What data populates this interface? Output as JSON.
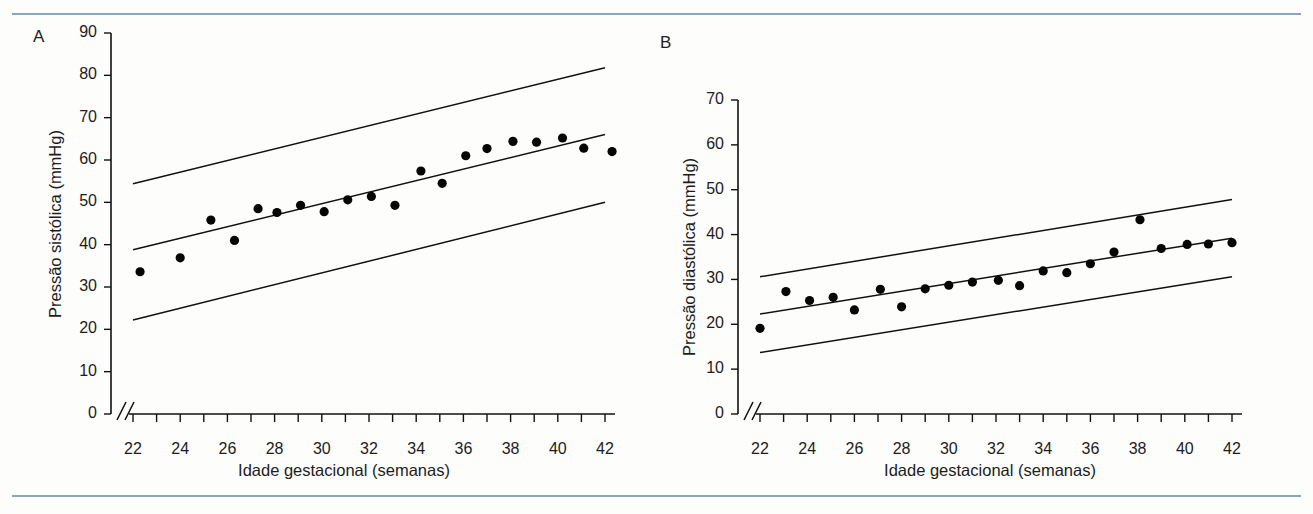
{
  "figure": {
    "background": "#fdfdfc",
    "rule_color": "#8ea3bd",
    "axis_color": "#111111",
    "point_color": "#050505"
  },
  "panels": [
    {
      "label": "A",
      "xlabel": "Idade gestacional (semanas)",
      "ylabel": "Pressão sistólica (mmHg)",
      "ylim": [
        0,
        90
      ],
      "yticks": [
        0,
        10,
        20,
        30,
        40,
        50,
        60,
        70,
        80,
        90
      ],
      "xlim": [
        22,
        42
      ],
      "xticks_all": [
        22,
        23,
        24,
        25,
        26,
        27,
        28,
        29,
        30,
        31,
        32,
        33,
        34,
        35,
        36,
        37,
        38,
        39,
        40,
        41,
        42
      ],
      "xticklabels": [
        "22",
        "24",
        "26",
        "28",
        "30",
        "32",
        "34",
        "36",
        "38",
        "40",
        "42"
      ],
      "xticklabel_values": [
        22,
        24,
        26,
        28,
        30,
        32,
        34,
        36,
        38,
        40,
        42
      ],
      "axis_break": true
    },
    {
      "label": "B",
      "xlabel": "Idade gestacional (semanas)",
      "ylabel": "Pressão diastólica (mmHg)",
      "ylim": [
        0,
        70
      ],
      "yticks": [
        0,
        10,
        20,
        30,
        40,
        50,
        60,
        70
      ],
      "xlim": [
        22,
        42
      ],
      "xticks_all": [
        22,
        23,
        24,
        25,
        26,
        27,
        28,
        29,
        30,
        31,
        32,
        33,
        34,
        35,
        36,
        37,
        38,
        39,
        40,
        41,
        42
      ],
      "xticklabels": [
        "22",
        "24",
        "26",
        "28",
        "30",
        "32",
        "34",
        "36",
        "38",
        "40",
        "42"
      ],
      "xticklabel_values": [
        22,
        24,
        26,
        28,
        30,
        32,
        34,
        36,
        38,
        40,
        42
      ],
      "axis_break": true
    }
  ],
  "chart_data": [
    {
      "type": "scatter",
      "panel": "A",
      "title": "",
      "xlabel": "Idade gestacional (semanas)",
      "ylabel": "Pressão sistólica (mmHg)",
      "xlim": [
        22,
        42
      ],
      "ylim": [
        0,
        90
      ],
      "grid": false,
      "legend": "none",
      "x": [
        22.3,
        24.0,
        25.3,
        26.3,
        27.3,
        28.1,
        29.1,
        30.1,
        31.1,
        32.1,
        33.1,
        34.2,
        35.1,
        36.1,
        37.0,
        38.1,
        39.1,
        40.2,
        41.1,
        42.3
      ],
      "y": [
        33.6,
        36.9,
        45.8,
        41.0,
        48.5,
        47.6,
        49.3,
        47.8,
        50.6,
        51.4,
        49.3,
        57.4,
        54.5,
        61.0,
        62.7,
        64.4,
        64.2,
        65.2,
        62.8,
        62.0
      ],
      "series": [
        {
          "name": "Média (linha de regressão)",
          "type": "line",
          "x": [
            22,
            42
          ],
          "y": [
            38.8,
            66.0
          ]
        },
        {
          "name": "Limite superior (+2 DP)",
          "type": "line",
          "x": [
            22,
            42
          ],
          "y": [
            54.4,
            81.8
          ]
        },
        {
          "name": "Limite inferior (-2 DP)",
          "type": "line",
          "x": [
            22,
            42
          ],
          "y": [
            22.2,
            50.0
          ]
        }
      ]
    },
    {
      "type": "scatter",
      "panel": "B",
      "title": "",
      "xlabel": "Idade gestacional (semanas)",
      "ylabel": "Pressão diastólica (mmHg)",
      "xlim": [
        22,
        42
      ],
      "ylim": [
        0,
        70
      ],
      "grid": false,
      "legend": "none",
      "x": [
        22.0,
        23.1,
        24.1,
        25.1,
        26.0,
        27.1,
        28.0,
        29.0,
        30.0,
        31.0,
        32.1,
        33.0,
        34.0,
        35.0,
        36.0,
        37.0,
        38.1,
        39.0,
        40.1,
        41.0,
        42.0
      ],
      "y": [
        19.1,
        27.3,
        25.3,
        26.0,
        23.2,
        27.8,
        23.9,
        27.9,
        28.7,
        29.4,
        29.8,
        28.6,
        31.9,
        31.5,
        33.5,
        36.1,
        43.3,
        36.9,
        37.8,
        37.9,
        38.2
      ],
      "series": [
        {
          "name": "Média (linha de regressão)",
          "type": "line",
          "x": [
            22,
            42
          ],
          "y": [
            22.3,
            39.2
          ]
        },
        {
          "name": "Limite superior (+2 DP)",
          "type": "line",
          "x": [
            22,
            42
          ],
          "y": [
            30.6,
            47.8
          ]
        },
        {
          "name": "Limite inferior (-2 DP)",
          "type": "line",
          "x": [
            22,
            42
          ],
          "y": [
            13.7,
            30.6
          ]
        }
      ]
    }
  ]
}
